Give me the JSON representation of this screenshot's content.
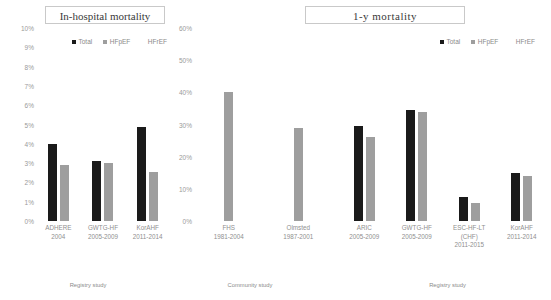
{
  "panels": [
    {
      "title": "In-hospital mortality",
      "legend": [
        {
          "label": "Total",
          "color": "#1a1a1a"
        },
        {
          "label": "HFpEF",
          "color": "#9e9e9e"
        },
        {
          "label": "HFrEF",
          "color": "#ffffff"
        }
      ],
      "bracket": "Registry study"
    },
    {
      "title": "1-y   mortality",
      "legend": [
        {
          "label": "Total",
          "color": "#1a1a1a"
        },
        {
          "label": "HFpEF",
          "color": "#9e9e9e"
        },
        {
          "label": "HFrEF",
          "color": "#ffffff"
        }
      ],
      "bracket_community": "Community study",
      "bracket_registry": "Registry study"
    }
  ],
  "chart_data": [
    {
      "type": "bar",
      "title": "In-hospital mortality",
      "xlabel": "",
      "ylabel": "",
      "ylim": [
        0,
        10
      ],
      "yticks": [
        "0%",
        "1%",
        "2%",
        "3%",
        "4%",
        "5%",
        "6%",
        "7%",
        "8%",
        "9%",
        "10%"
      ],
      "grid": false,
      "legend_position": "top",
      "categories": [
        "ADHERE\n2004",
        "GWTG-HF\n2005-2009",
        "KorAHF\n2011-2014"
      ],
      "category_lines": [
        [
          "ADHERE",
          "2004"
        ],
        [
          "GWTG-HF",
          "2005-2009"
        ],
        [
          "KorAHF",
          "2011-2014"
        ]
      ],
      "series": [
        {
          "name": "Total",
          "color": "#1a1a1a",
          "values": [
            4.0,
            3.1,
            4.85
          ]
        },
        {
          "name": "HFpEF",
          "color": "#9e9e9e",
          "values": [
            2.9,
            3.0,
            2.55
          ]
        },
        {
          "name": "HFrEF",
          "color": "#ffffff",
          "values": [
            null,
            null,
            null
          ]
        }
      ],
      "group_bracket": "Registry study"
    },
    {
      "type": "bar",
      "title": "1-y   mortality",
      "xlabel": "",
      "ylabel": "",
      "ylim": [
        0,
        60
      ],
      "yticks": [
        "0%",
        "10%",
        "20%",
        "30%",
        "40%",
        "50%",
        "60%"
      ],
      "grid": false,
      "legend_position": "top",
      "categories": [
        "FHS\n1981-2004",
        "Olmsted\n1987-2001"
      ],
      "category_lines": [
        [
          "FHS",
          "1981-2004"
        ],
        [
          "Olmsted",
          "1987-2001"
        ]
      ],
      "series": [
        {
          "name": "Total",
          "color": "#1a1a1a",
          "values": [
            null,
            null
          ]
        },
        {
          "name": "HFpEF",
          "color": "#9e9e9e",
          "values": [
            40.0,
            29.0
          ]
        },
        {
          "name": "HFrEF",
          "color": "#ffffff",
          "values": [
            null,
            null
          ]
        }
      ],
      "group_bracket": "Community study"
    },
    {
      "type": "bar",
      "title": "1-y   mortality",
      "xlabel": "",
      "ylabel": "",
      "ylim": [
        0,
        60
      ],
      "yticks": [
        "0%",
        "10%",
        "20%",
        "30%",
        "40%",
        "50%",
        "60%"
      ],
      "grid": false,
      "legend_position": "top",
      "categories": [
        "ARIC\n2005-2009",
        "GWTG-HF\n2005-2009",
        "ESC-HF-LT (CHF)\n2011-2015",
        "KorAHF\n2011-2014"
      ],
      "category_lines": [
        [
          "ARIC",
          "2005-2009"
        ],
        [
          "GWTG-HF",
          "2005-2009"
        ],
        [
          "ESC-HF-LT",
          "(CHF)",
          "2011-2015"
        ],
        [
          "KorAHF",
          "2011-2014"
        ]
      ],
      "series": [
        {
          "name": "Total",
          "color": "#1a1a1a",
          "values": [
            29.5,
            34.5,
            7.5,
            15.0
          ]
        },
        {
          "name": "HFpEF",
          "color": "#9e9e9e",
          "values": [
            26.0,
            34.0,
            5.5,
            14.0
          ]
        },
        {
          "name": "HFrEF",
          "color": "#ffffff",
          "values": [
            null,
            null,
            null,
            null
          ]
        }
      ],
      "group_bracket": "Registry study"
    }
  ]
}
